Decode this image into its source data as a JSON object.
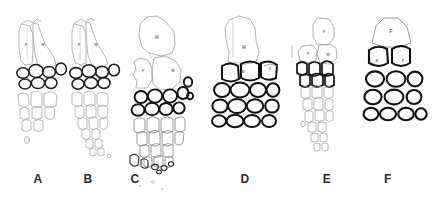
{
  "figure": {
    "type": "scientific-line-drawing-plate",
    "background_color": "#ffffff",
    "ink_color": "#1a1a1a",
    "light_ink_color": "#8c8c8c",
    "panel_count": 6
  },
  "panel_labels": [
    {
      "text": "A",
      "x": 30,
      "y": 178
    },
    {
      "text": "B",
      "x": 80,
      "y": 178
    },
    {
      "text": "C",
      "x": 127,
      "y": 178
    },
    {
      "text": "D",
      "x": 237,
      "y": 178
    },
    {
      "text": "E",
      "x": 319,
      "y": 178
    },
    {
      "text": "F",
      "x": 380,
      "y": 178
    }
  ],
  "panels": [
    {
      "id": "A",
      "label": "A",
      "style": "faint-outline-tapering",
      "top_elements": [
        {
          "label": "F",
          "x": 26,
          "y": 45
        },
        {
          "label": "M",
          "x": 43,
          "y": 45
        }
      ],
      "bold_cell_rows": 2,
      "faint_cell_rows": 3,
      "outline_weight": "light"
    },
    {
      "id": "B",
      "label": "B",
      "style": "faint-outline-long-tapering",
      "top_elements": [
        {
          "label": "F",
          "x": 79,
          "y": 45
        },
        {
          "label": "M",
          "x": 96,
          "y": 45
        }
      ],
      "bold_cell_rows": 2,
      "faint_cell_rows": 6,
      "outline_weight": "light"
    },
    {
      "id": "C",
      "label": "C",
      "style": "large-head-long-tapering",
      "top_elements": [
        {
          "label": "H",
          "x": 157,
          "y": 38
        },
        {
          "label": "F",
          "x": 143,
          "y": 70
        },
        {
          "label": "M",
          "x": 173,
          "y": 70
        }
      ],
      "bold_cell_rows": 3,
      "faint_cell_rows": 6,
      "outline_weight": "mixed"
    },
    {
      "id": "D",
      "label": "D",
      "style": "broad-block",
      "top_elements": [
        {
          "label": "H",
          "x": 244,
          "y": 47
        },
        {
          "label": "M",
          "x": 243,
          "y": 74
        },
        {
          "label": "F",
          "x": 272,
          "y": 70
        }
      ],
      "bold_cell_rows": 4,
      "faint_cell_rows": 0,
      "outline_weight": "bold"
    },
    {
      "id": "E",
      "label": "E",
      "style": "small-head-tapering",
      "top_elements": [
        {
          "label": "F",
          "x": 325,
          "y": 37
        },
        {
          "label": "F",
          "x": 310,
          "y": 52
        },
        {
          "label": "M",
          "x": 330,
          "y": 55
        }
      ],
      "bold_cell_rows": 2,
      "faint_cell_rows": 6,
      "outline_weight": "mixed"
    },
    {
      "id": "F",
      "label": "F",
      "style": "broad-block-open",
      "top_elements": [
        {
          "label": "F",
          "x": 389,
          "y": 34
        },
        {
          "label": "E",
          "x": 376,
          "y": 61
        },
        {
          "label": "F",
          "x": 403,
          "y": 61
        }
      ],
      "bold_cell_rows": 4,
      "faint_cell_rows": 0,
      "outline_weight": "bold"
    }
  ]
}
